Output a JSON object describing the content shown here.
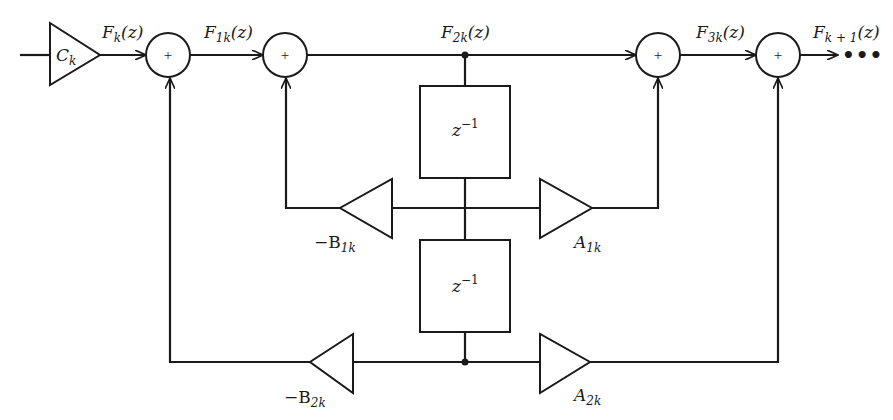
{
  "diagram": {
    "type": "lattice-filter-block-diagram",
    "gain_input": {
      "label": "C",
      "sub": "k"
    },
    "signals": {
      "fk": {
        "main": "F",
        "sub": "k",
        "arg": "(z)"
      },
      "f1k": {
        "main": "F",
        "sub": "1k",
        "arg": "(z)"
      },
      "f2k": {
        "main": "F",
        "sub": "2k",
        "arg": "(z)"
      },
      "f3k": {
        "main": "F",
        "sub": "3k",
        "arg": "(z)"
      },
      "fk1": {
        "main": "F",
        "sub": "k + 1",
        "arg": "(z)"
      }
    },
    "summer_symbol": "+",
    "delays": [
      {
        "base": "z",
        "exp": "−1"
      },
      {
        "base": "z",
        "exp": "−1"
      }
    ],
    "gains": {
      "b1k": {
        "main": "−B",
        "sub": "1k"
      },
      "a1k": {
        "main": "A",
        "sub": "1k"
      },
      "b2k": {
        "main": "−B",
        "sub": "2k"
      },
      "a2k": {
        "main": "A",
        "sub": "2k"
      }
    },
    "continuation": "•••",
    "colors": {
      "line": "#1a1a1a",
      "background": "#ffffff"
    }
  }
}
